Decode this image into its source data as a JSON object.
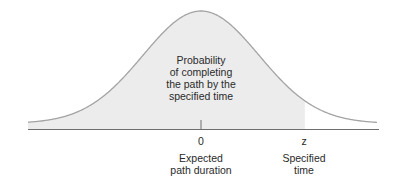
{
  "diagram": {
    "type": "normal-distribution",
    "region_label": [
      "Probability",
      "of completing",
      "the path by the",
      "specified time"
    ],
    "axis": {
      "mean_tick_label": "0",
      "mean_caption": [
        "Expected",
        "path duration"
      ],
      "z_tick_label": "z",
      "z_caption": [
        "Specified",
        "time"
      ]
    },
    "colors": {
      "curve": "#a3a3a3",
      "fill": "#ececec",
      "axis": "#6e6e6e",
      "text": "#2a2a2a"
    }
  },
  "chart_data": {
    "type": "area",
    "title": "",
    "x_ticks": [
      "0",
      "z"
    ],
    "shaded_range": [
      "-inf",
      "z"
    ],
    "z_approx_sd": 1.79,
    "annotations": [
      "Probability of completing the path by the specified time",
      "Expected path duration",
      "Specified time"
    ]
  }
}
